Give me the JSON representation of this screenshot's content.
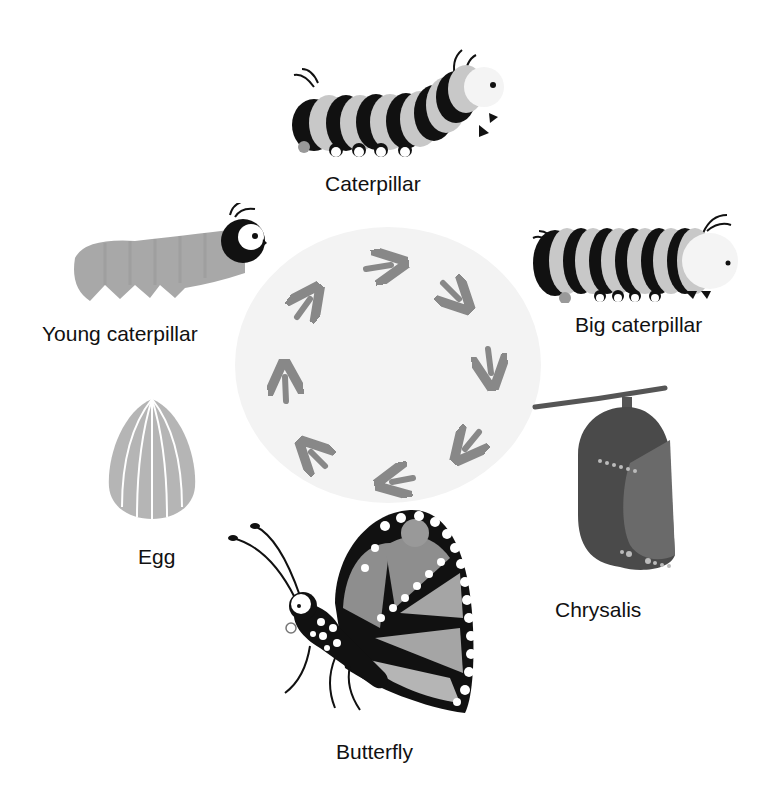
{
  "colors": {
    "background": "#ffffff",
    "cycle_circle": "#f3f3f3",
    "arrow": "#888888",
    "dark": "#111111",
    "light_stripe": "#c8c8c8",
    "wing": "#8e8e8e",
    "chrysalis": "#555555",
    "egg": "#b5b5b5"
  },
  "cycle": {
    "direction": "clockwise",
    "arrow_count": 8
  },
  "stages": [
    {
      "id": "egg",
      "label": "Egg"
    },
    {
      "id": "young-caterpillar",
      "label": "Young caterpillar"
    },
    {
      "id": "caterpillar",
      "label": "Caterpillar"
    },
    {
      "id": "big-caterpillar",
      "label": "Big caterpillar"
    },
    {
      "id": "chrysalis",
      "label": "Chrysalis"
    },
    {
      "id": "butterfly",
      "label": "Butterfly"
    }
  ]
}
